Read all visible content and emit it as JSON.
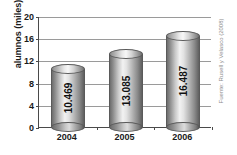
{
  "chart_data": {
    "type": "bar",
    "title": "",
    "subtitle": "",
    "xlabel": "",
    "ylabel": "alumnos (miles)",
    "categories": [
      "2004",
      "2005",
      "2006"
    ],
    "values": [
      10.469,
      13.085,
      16.487
    ],
    "data_labels": [
      "10.469",
      "13.085",
      "16.487"
    ],
    "ylim": [
      0,
      20
    ],
    "ytick_values": [
      0,
      4,
      8,
      12,
      16,
      20
    ],
    "ytick_labels": [
      "0",
      "4",
      "8",
      "12",
      "16",
      "20"
    ],
    "grid": true,
    "grid_axis": "y",
    "legend": false,
    "legend_position": "none",
    "style": "3d-cylinder",
    "palette": [
      "#c9c9c9"
    ],
    "colors": {
      "bar_light": "#f2f2f2",
      "bar_mid": "#b4b4b4",
      "bar_dark": "#5f5f5f",
      "axis": "#4a4a4a",
      "gridline": "#9a9a9a",
      "text": "#1a1a1a",
      "source_text": "#8d8d8d",
      "background": "#ffffff"
    }
  },
  "annotations": {
    "source_note": "Fuente: Rusell y Velasco (2008)"
  }
}
